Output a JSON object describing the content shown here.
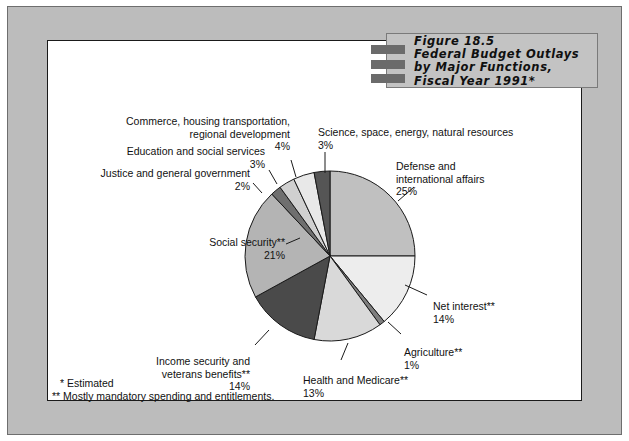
{
  "figure": {
    "title_lines": [
      "Figure 18.5",
      "Federal Budget Outlays",
      "by Major Functions,",
      "Fiscal Year 1991*"
    ],
    "footnotes": [
      "*  Estimated",
      "** Mostly mandatory spending and entitlements."
    ]
  },
  "colors": {
    "frame": "#bcbcbc",
    "title_block": "#c3c3c3",
    "title_bar": "#6b6b6b",
    "outline": "#1a1a1a"
  },
  "labels": {
    "defense": {
      "name": "Defense and\ninternational affairs",
      "pct": "25%"
    },
    "net_interest": {
      "name": "Net interest**",
      "pct": "14%"
    },
    "agriculture": {
      "name": "Agriculture**",
      "pct": "1%"
    },
    "health": {
      "name": "Health and Medicare**",
      "pct": "13%"
    },
    "income": {
      "name": "Income security and\nveterans benefits**",
      "pct": "14%"
    },
    "social": {
      "name": "Social security**",
      "pct": "21%"
    },
    "justice": {
      "name": "Justice and general government",
      "pct": "2%"
    },
    "education": {
      "name": "Education and social services",
      "pct": "3%"
    },
    "commerce": {
      "name": "Commerce, housing transportation,\nregional development",
      "pct": "4%"
    },
    "science": {
      "name": "Science, space, energy, natural resources",
      "pct": "3%"
    }
  },
  "chart_data": {
    "type": "pie",
    "title": "Figure 18.5 Federal Budget Outlays by Major Functions, Fiscal Year 1991*",
    "xlabel": "",
    "ylabel": "",
    "units": "percent of total federal budget outlays",
    "start_angle_deg": 0,
    "direction": "clockwise",
    "legend": "none (direct labels with leader lines)",
    "grid": false,
    "center": [
      330,
      256
    ],
    "radius": 85,
    "categories": [
      "Defense and international affairs",
      "Net interest**",
      "Agriculture**",
      "Health and Medicare**",
      "Income security and veterans benefits**",
      "Social security**",
      "Justice and general government",
      "Education and social services",
      "Commerce, housing transportation, regional development",
      "Science, space, energy, natural resources"
    ],
    "values": [
      25,
      14,
      1,
      13,
      14,
      21,
      2,
      3,
      4,
      3
    ],
    "slice_colors": [
      "#c0c0c0",
      "#ededed",
      "#7e7e7e",
      "#d9d9d9",
      "#4a4a4a",
      "#b4b4b4",
      "#6f6f6f",
      "#d0d0d0",
      "#e8e8e8",
      "#555555"
    ],
    "total": 100
  }
}
